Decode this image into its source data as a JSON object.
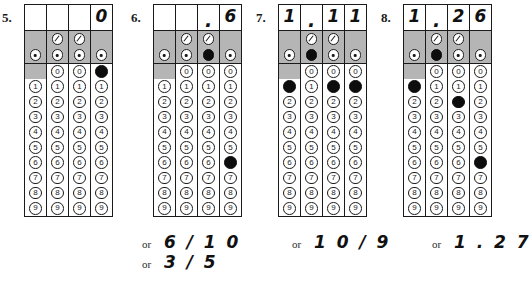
{
  "worksheet": {
    "title": "Grid-in answer bubble sheets",
    "digits": [
      "0",
      "1",
      "2",
      "3",
      "4",
      "5",
      "6",
      "7",
      "8",
      "9"
    ],
    "slash_symbol": "/",
    "decimal_symbol": ".",
    "or_label": "or",
    "columns_per_grid": 4,
    "slash_columns": [
      2,
      3
    ],
    "blank_zero_column": 1
  },
  "problems": [
    {
      "number": "5.",
      "written": [
        "",
        "",
        "",
        "0"
      ],
      "filled_slash": [
        false,
        false,
        false,
        false
      ],
      "filled_decimal": [
        false,
        false,
        false,
        false
      ],
      "filled_digits": [
        null,
        null,
        null,
        "0"
      ],
      "alternates": []
    },
    {
      "number": "6.",
      "written": [
        "",
        "",
        ".",
        "6"
      ],
      "filled_slash": [
        false,
        false,
        false,
        false
      ],
      "filled_decimal": [
        false,
        false,
        true,
        false
      ],
      "filled_digits": [
        null,
        null,
        null,
        "6"
      ],
      "alternates": [
        "6 / 1 0",
        "3 / 5"
      ]
    },
    {
      "number": "7.",
      "written": [
        "1",
        ".",
        "1",
        "1"
      ],
      "filled_slash": [
        false,
        false,
        false,
        false
      ],
      "filled_decimal": [
        false,
        true,
        false,
        false
      ],
      "filled_digits": [
        "1",
        null,
        "1",
        "1"
      ],
      "alternates": [
        "1 0 / 9"
      ]
    },
    {
      "number": "8.",
      "written": [
        "1",
        ".",
        "2",
        "6"
      ],
      "filled_slash": [
        false,
        false,
        false,
        false
      ],
      "filled_decimal": [
        false,
        true,
        false,
        false
      ],
      "filled_digits": [
        "1",
        null,
        "2",
        "6"
      ],
      "alternates": [
        "1 . 2 7"
      ]
    }
  ]
}
